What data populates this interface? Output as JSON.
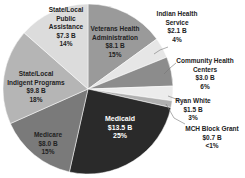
{
  "chart_data": {
    "type": "pie",
    "title": "",
    "start_angle_deg": 0,
    "direction": "clockwise",
    "slices": [
      {
        "name": "Veterans Health Administration",
        "value": 8.1,
        "value_label": "$8.1 B",
        "pct_label": "15%",
        "color": "#9a9a9a"
      },
      {
        "name": "Indian Health Service",
        "value": 2.1,
        "value_label": "$2.1 B",
        "pct_label": "4%",
        "color": "#e6e6e6"
      },
      {
        "name": "Community Health Centers",
        "value": 3.0,
        "value_label": "$3.0 B",
        "pct_label": "6%",
        "color": "#8c8c8c"
      },
      {
        "name": "Ryan White",
        "value": 1.5,
        "value_label": "$1.5 B",
        "pct_label": "3%",
        "color": "#ececec"
      },
      {
        "name": "MCH Block Grant",
        "value": 0.7,
        "value_label": "$0.7 B",
        "pct_label": "<1%",
        "color": "#b0b0b0"
      },
      {
        "name": "Medicaid",
        "value": 13.5,
        "value_label": "$13.5 B",
        "pct_label": "25%",
        "color": "#2a2a2a"
      },
      {
        "name": "Medicare",
        "value": 8.0,
        "value_label": "$8.0 B",
        "pct_label": "15%",
        "color": "#7a7a7a"
      },
      {
        "name": "State/Local Indigent Programs",
        "value": 9.8,
        "value_label": "$9.8 B",
        "pct_label": "18%",
        "color": "#b5b5b5"
      },
      {
        "name": "State/Local Public Assistance",
        "value": 7.3,
        "value_label": "$7.3 B",
        "pct_label": "14%",
        "color": "#dcdcdc"
      }
    ]
  },
  "labels": {
    "veterans": {
      "l1": "Veterans Health",
      "l2": "Administration",
      "v": "$8.1 B",
      "p": "15%"
    },
    "indian": {
      "l1": "Indian Health",
      "l2": "Service",
      "v": "$2.1 B",
      "p": "4%"
    },
    "chc": {
      "l1": "Community Health",
      "l2": "Centers",
      "v": "$3.0 B",
      "p": "6%"
    },
    "ryan": {
      "l1": "Ryan White",
      "v": "$1.5 B",
      "p": "3%"
    },
    "mch": {
      "l1": "MCH Block Grant",
      "v": "$0.7 B",
      "p": "<1%"
    },
    "medicaid": {
      "l1": "Medicaid",
      "v": "$13.5 B",
      "p": "25%"
    },
    "medicare": {
      "l1": "Medicare",
      "v": "$8.0 B",
      "p": "15%"
    },
    "indigent": {
      "l1": "State/Local",
      "l2": "Indigent Programs",
      "v": "$9.8 B",
      "p": "18%"
    },
    "public": {
      "l1": "State/Local",
      "l2": "Public",
      "l3": "Assistance",
      "v": "$7.3 B",
      "p": "14%"
    }
  }
}
